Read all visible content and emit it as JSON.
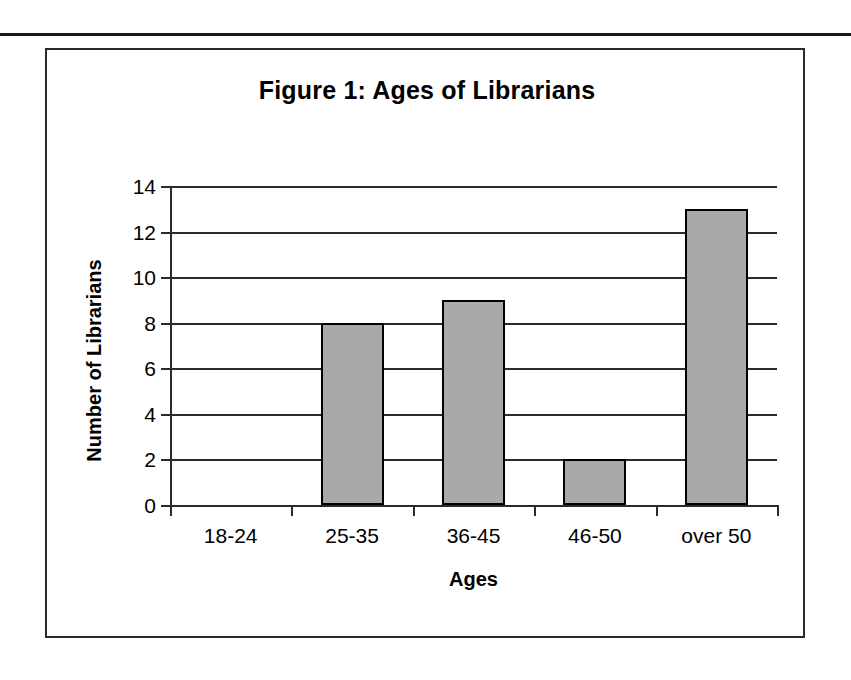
{
  "page": {
    "background_color": "#ffffff",
    "rule_color": "#1a1a1a"
  },
  "figure": {
    "frame_border_color": "#2a2a2a",
    "title": "Figure 1: Ages of Librarians"
  },
  "chart_data": {
    "type": "bar",
    "title": "Figure 1: Ages of Librarians",
    "xlabel": "Ages",
    "ylabel": "Number of Librarians",
    "categories": [
      "18-24",
      "25-35",
      "36-45",
      "46-50",
      "over 50"
    ],
    "values": [
      0,
      8,
      9,
      2,
      13
    ],
    "ylim": [
      0,
      14
    ],
    "ytick_step": 2,
    "yticks": [
      "0",
      "2",
      "4",
      "6",
      "8",
      "10",
      "12",
      "14"
    ],
    "grid": true,
    "grid_axis": "y",
    "legend": false,
    "bar_fill_color": "#a9a9a9",
    "bar_edge_color": "#000000",
    "axis_color": "#2b2b2b"
  }
}
